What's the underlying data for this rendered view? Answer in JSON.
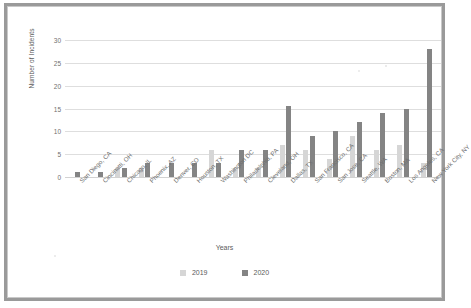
{
  "chart_data": {
    "type": "bar",
    "title": "",
    "xlabel": "Years",
    "ylabel": "Number of Incidents",
    "ylim": [
      0,
      30
    ],
    "yticks": [
      0,
      5,
      10,
      15,
      20,
      25,
      30
    ],
    "grid": true,
    "legend_position": "bottom",
    "categories": [
      "San Diego, CA",
      "Cincinatti, OH",
      "Chicago, IL",
      "Phoenix, AZ",
      "Denver, CO",
      "Houston, TX",
      "Washington DC",
      "Philadelphia, PA",
      "Cleveland, OH",
      "Dallas, TX",
      "San Francisco, CA",
      "San Jose, CA",
      "Seattle, WA",
      "Boston, MA",
      "Los Angeles, CA",
      "New York City, NY"
    ],
    "series": [
      {
        "name": "2019",
        "color": "#d6d6d6",
        "values": [
          0,
          0,
          2,
          2,
          0,
          0,
          6,
          2,
          2,
          7,
          6,
          4,
          9,
          6,
          7,
          3
        ]
      },
      {
        "name": "2020",
        "color": "#848484",
        "values": [
          1,
          1,
          2,
          3,
          3,
          3,
          3,
          6,
          6,
          15.5,
          9,
          10,
          12,
          14,
          15,
          28
        ]
      }
    ]
  },
  "legend": {
    "items": [
      {
        "label": "2019"
      },
      {
        "label": "2020"
      }
    ]
  },
  "colors": {
    "series_2019": "#d6d6d6",
    "series_2020": "#848484",
    "gridline": "#dedede",
    "frame": "#9a9a9a",
    "text": "#5b5b5b"
  }
}
